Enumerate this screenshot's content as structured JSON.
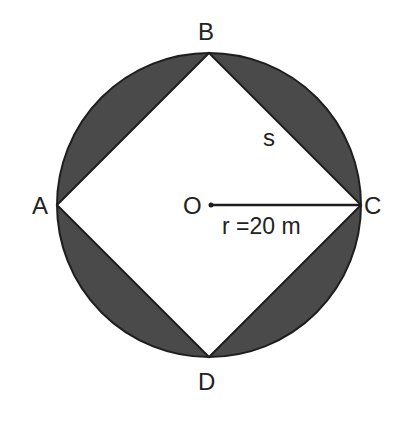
{
  "diagram": {
    "colors": {
      "background": "#ffffff",
      "shaded_segments": "#4a4a4a",
      "stroke": "#1e1e1e",
      "square_fill": "#ffffff",
      "text": "#222222"
    },
    "geometry": {
      "center": {
        "x": 209,
        "y": 205
      },
      "radius_px": 152
    },
    "points": {
      "A": {
        "label": "A",
        "x": 57,
        "y": 205
      },
      "B": {
        "label": "B",
        "x": 209,
        "y": 53
      },
      "C": {
        "label": "C",
        "x": 361,
        "y": 205
      },
      "D": {
        "label": "D",
        "x": 209,
        "y": 357
      },
      "O": {
        "label": "O",
        "x": 209,
        "y": 205
      }
    },
    "labels": {
      "A": "A",
      "B": "B",
      "C": "C",
      "D": "D",
      "O": "O",
      "side": "s",
      "radius": "r =20 m"
    }
  }
}
